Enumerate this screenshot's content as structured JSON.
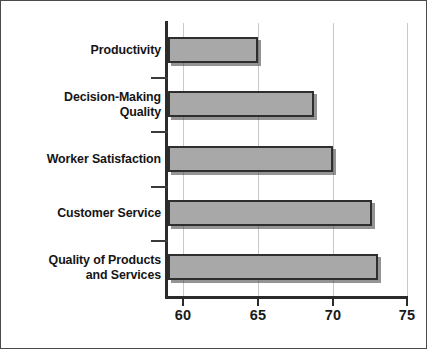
{
  "chart_data": {
    "type": "bar",
    "orientation": "horizontal",
    "title": "",
    "subtitle": "",
    "xlabel": "",
    "ylabel": "",
    "categories": [
      "Productivity",
      "Decision-Making Quality",
      "Worker Satisfaction",
      "Customer Service",
      "Quality of Products and Services"
    ],
    "category_lines": [
      [
        "Productivity"
      ],
      [
        "Decision-Making",
        "Quality"
      ],
      [
        "Worker Satisfaction"
      ],
      [
        "Customer Service"
      ],
      [
        "Quality of Products",
        "and Services"
      ]
    ],
    "values": [
      65.0,
      68.7,
      70.0,
      72.6,
      73.0
    ],
    "xlim": [
      59,
      75
    ],
    "xticks": [
      60,
      65,
      70,
      75
    ],
    "xtick_labels": [
      "60",
      "65",
      "70",
      "75"
    ],
    "grid": true,
    "grid_axis": "x",
    "legend": null,
    "bar_color": "#a8a8a8",
    "bar_edge_color": "#2e2e2e",
    "axis_color": "#2b2b2b",
    "grid_color": "#c9c9c9",
    "background_color": "#ffffff",
    "frame_color": "#4a4a4a"
  }
}
